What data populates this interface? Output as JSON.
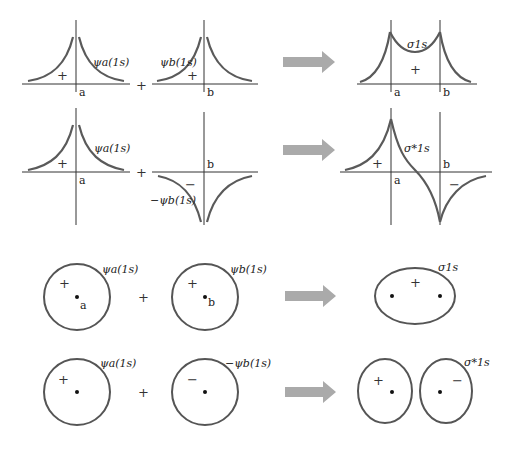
{
  "colors": {
    "curve": "#5a5a5a",
    "arrow": "#aaaaaa",
    "axis": "#333333"
  },
  "rows": [
    {
      "name": "bonding-wavefunction",
      "left_label": "ψa(1s)",
      "right_label": "ψb(1s)",
      "operator": "+",
      "left_sign": "+",
      "right_sign": "+",
      "point_a": "a",
      "point_b": "b",
      "result_label": "σ1s",
      "result_sign": "+"
    },
    {
      "name": "antibonding-wavefunction",
      "left_label": "ψa(1s)",
      "right_label": "−ψb(1s)",
      "operator": "+",
      "left_sign": "+",
      "right_sign": "−",
      "point_a": "a",
      "point_b": "b",
      "result_label": "σ*1s",
      "result_sign_pos": "+",
      "result_sign_neg": "−"
    },
    {
      "name": "bonding-orbital-contour",
      "left_label": "ψa(1s)",
      "right_label": "ψb(1s)",
      "operator": "+",
      "left_sign": "+",
      "right_sign": "+",
      "point_a": "a",
      "point_b": "b",
      "result_label": "σ1s",
      "result_sign": "+"
    },
    {
      "name": "antibonding-orbital-contour",
      "left_label": "ψa(1s)",
      "right_label": "−ψb(1s)",
      "operator": "+",
      "left_sign": "+",
      "right_sign": "−",
      "result_label": "σ*1s",
      "result_sign_pos": "+",
      "result_sign_neg": "−"
    }
  ]
}
